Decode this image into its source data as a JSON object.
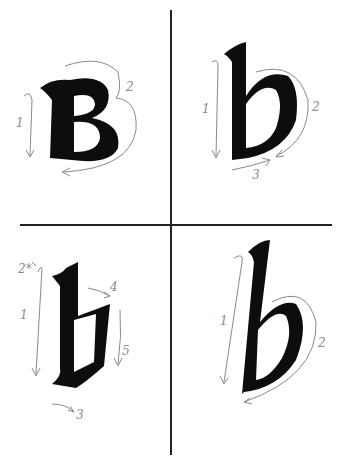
{
  "figure": {
    "colors": {
      "ink": "#0d0d0d",
      "guide": "#8a8a8a",
      "rule": "#222222"
    },
    "panels": [
      {
        "id": "top-left",
        "letter": "B",
        "style": "uncial capital",
        "strokes": [
          "1",
          "2"
        ]
      },
      {
        "id": "top-right",
        "letter": "b",
        "style": "foundational minuscule",
        "strokes": [
          "1",
          "2",
          "3"
        ]
      },
      {
        "id": "bottom-left",
        "letter": "b",
        "style": "blackletter gothic",
        "strokes": [
          "2*",
          "1",
          "4",
          "5",
          "3"
        ]
      },
      {
        "id": "bottom-right",
        "letter": "b",
        "style": "italic",
        "strokes": [
          "1",
          "2"
        ]
      }
    ]
  }
}
